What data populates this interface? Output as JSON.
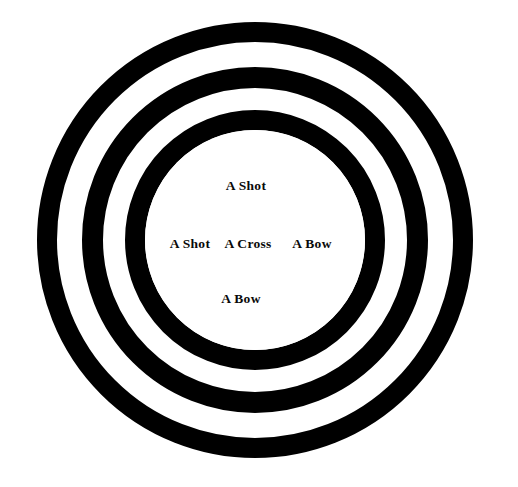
{
  "figure": {
    "background_color": "#ffffff",
    "ring_color": "#000000",
    "text_color": "#0a0a0a"
  },
  "diagram": {
    "type": "concentric-circles",
    "center": {
      "x": 255,
      "y": 240
    },
    "rings": [
      {
        "name": "outer-ring",
        "outer_radius": 218,
        "inner_radius": 198,
        "color": "#000000"
      },
      {
        "name": "middle-ring",
        "outer_radius": 173,
        "inner_radius": 152,
        "color": "#000000"
      },
      {
        "name": "inner-ring",
        "outer_radius": 130,
        "inner_radius": 110,
        "color": "#000000"
      }
    ],
    "center_disc": {
      "name": "center-disc",
      "radius": 110,
      "color": "#ffffff"
    }
  },
  "labels": {
    "top": "A Shot",
    "left": "A Shot",
    "center": "A Cross",
    "right": "A Bow",
    "bottom": "A Bow"
  }
}
